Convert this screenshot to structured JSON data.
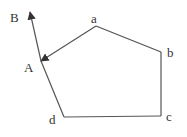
{
  "diagram": {
    "type": "polygon-with-ray",
    "colors": {
      "stroke": "#555555",
      "text": "#333333",
      "background": "#ffffff"
    },
    "vertices": [
      {
        "id": "a",
        "label": "a",
        "x": 96,
        "y": 26,
        "label_x": 91,
        "label_y": 23
      },
      {
        "id": "b",
        "label": "b",
        "x": 161,
        "y": 52,
        "label_x": 167,
        "label_y": 57
      },
      {
        "id": "c",
        "label": "c",
        "x": 161,
        "y": 116,
        "label_x": 166,
        "label_y": 121
      },
      {
        "id": "d",
        "label": "d",
        "x": 64,
        "y": 117,
        "label_x": 49,
        "label_y": 124
      },
      {
        "id": "A",
        "label": "A",
        "x": 41,
        "y": 61,
        "label_x": 24,
        "label_y": 72
      }
    ],
    "points": [
      {
        "id": "B",
        "label": "B",
        "x": 30,
        "y": 12,
        "label_x": 10,
        "label_y": 22
      }
    ],
    "edges": [
      {
        "from": "a",
        "to": "b"
      },
      {
        "from": "b",
        "to": "c"
      },
      {
        "from": "c",
        "to": "d"
      },
      {
        "from": "d",
        "to": "A"
      },
      {
        "from": "a",
        "to": "A",
        "arrow_at": "A"
      },
      {
        "from": "A",
        "to": "B",
        "arrow_at": "B"
      }
    ]
  }
}
